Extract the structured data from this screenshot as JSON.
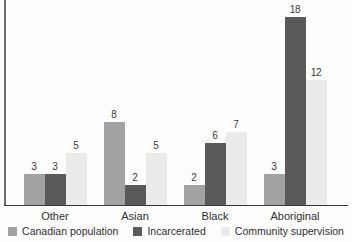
{
  "chart_data": {
    "type": "bar",
    "title": "",
    "xlabel": "",
    "ylabel": "",
    "categories": [
      "Other",
      "Asian",
      "Black",
      "Aboriginal"
    ],
    "series": [
      {
        "name": "Canadian population",
        "color": "#a2a2a2",
        "values": [
          3,
          8,
          2,
          3
        ]
      },
      {
        "name": "Incarcerated",
        "color": "#5a5a5a",
        "values": [
          3,
          2,
          6,
          18
        ]
      },
      {
        "name": "Community supervision",
        "color": "#ebebeb",
        "values": [
          5,
          5,
          7,
          12
        ]
      }
    ],
    "value_labels": [
      [
        3,
        8,
        2,
        3
      ],
      [
        3,
        2,
        6,
        18
      ],
      [
        5,
        5,
        7,
        12
      ]
    ],
    "ylim": [
      0,
      19
    ],
    "grid": false,
    "y_axis_ticks": [],
    "legend_position": "bottom"
  },
  "colors": {
    "background": "#fdfdfc",
    "axis_x": "#383838",
    "axis_y": "#6f6f6f",
    "value_text": "#3a3a3a",
    "category_text": "#2e2e2e",
    "legend_text": "#2e2e2e"
  }
}
